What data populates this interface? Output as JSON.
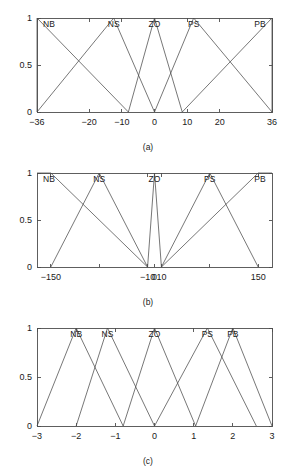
{
  "figure": {
    "panel_count": 3,
    "line_color": "#4a4a4a",
    "axis_color": "#4d4d4d",
    "background": "#ffffff"
  },
  "chart_data": [
    {
      "type": "line",
      "panel": "a",
      "caption": "(a)",
      "title": "",
      "xlabel": "",
      "ylabel": "",
      "xlim": [
        -36,
        36
      ],
      "ylim": [
        0,
        1
      ],
      "grid": false,
      "legend": "inline-top-labels",
      "xticks": [
        -36,
        -20,
        -10,
        0,
        10,
        20,
        36
      ],
      "xticklabels": [
        "-36",
        "-20",
        "-10",
        "0",
        "10",
        "20",
        "36"
      ],
      "yticks": [
        0,
        0.5,
        1
      ],
      "yticklabels": [
        "0",
        "0.5",
        "1"
      ],
      "series": [
        {
          "name": "NB",
          "label_x": -33.0,
          "shape": "triangle",
          "x": [
            -36,
            -36,
            -8
          ],
          "y": [
            0,
            1,
            0
          ]
        },
        {
          "name": "NS",
          "label_x": -12.5,
          "shape": "triangle",
          "x": [
            -36,
            -12.5,
            0
          ],
          "y": [
            0,
            1,
            0
          ]
        },
        {
          "name": "ZO",
          "label_x": 0.0,
          "shape": "triangle",
          "x": [
            -8,
            0,
            8.5
          ],
          "y": [
            0,
            1,
            0
          ]
        },
        {
          "name": "PS",
          "label_x": 12.0,
          "shape": "triangle",
          "x": [
            0,
            12,
            36
          ],
          "y": [
            0,
            1,
            0
          ]
        },
        {
          "name": "PB",
          "label_x": 33.0,
          "shape": "triangle",
          "x": [
            8.5,
            36,
            36
          ],
          "y": [
            0,
            1,
            0
          ]
        }
      ]
    },
    {
      "type": "line",
      "panel": "b",
      "caption": "(b)",
      "title": "",
      "xlabel": "",
      "ylabel": "",
      "xlim": [
        -170,
        170
      ],
      "ylim": [
        0,
        1
      ],
      "grid": false,
      "legend": "inline-top-labels",
      "xticks": [
        -150,
        -80,
        -10,
        0,
        10,
        80,
        150
      ],
      "xticklabels": [
        "-150",
        "",
        "-10",
        "0",
        "10",
        "",
        "150"
      ],
      "yticks": [
        0,
        0.5,
        1
      ],
      "yticklabels": [
        "0",
        "0.5",
        "1"
      ],
      "series": [
        {
          "name": "NB",
          "label_x": -155.0,
          "shape": "trapezoid",
          "x": [
            -170,
            -150,
            -10
          ],
          "y": [
            1,
            1,
            0
          ]
        },
        {
          "name": "NS",
          "label_x": -80.0,
          "shape": "triangle",
          "x": [
            -150,
            -80,
            -10
          ],
          "y": [
            0,
            1,
            0
          ]
        },
        {
          "name": "ZO",
          "label_x": 0.0,
          "shape": "triangle",
          "x": [
            -10,
            0,
            10
          ],
          "y": [
            0,
            1,
            0
          ]
        },
        {
          "name": "PS",
          "label_x": 80.0,
          "shape": "triangle",
          "x": [
            10,
            80,
            150
          ],
          "y": [
            0,
            1,
            0
          ]
        },
        {
          "name": "PB",
          "label_x": 155.0,
          "shape": "trapezoid",
          "x": [
            10,
            150,
            170
          ],
          "y": [
            0,
            1,
            1
          ]
        }
      ]
    },
    {
      "type": "line",
      "panel": "c",
      "caption": "(c)",
      "title": "",
      "xlabel": "",
      "ylabel": "",
      "xlim": [
        -3,
        3
      ],
      "ylim": [
        0,
        1
      ],
      "grid": false,
      "legend": "inline-top-labels",
      "xticks": [
        -3,
        -2,
        -1,
        0,
        1,
        2,
        3
      ],
      "xticklabels": [
        "-3",
        "-2",
        "-1",
        "0",
        "1",
        "2",
        "3"
      ],
      "yticks": [
        0,
        0.5,
        1
      ],
      "yticklabels": [
        "0",
        "0.5",
        "1"
      ],
      "series": [
        {
          "name": "NB",
          "label_x": -2.0,
          "shape": "triangle",
          "x": [
            -3,
            -2,
            -0.8
          ],
          "y": [
            0,
            1,
            0
          ]
        },
        {
          "name": "NS",
          "label_x": -1.2,
          "shape": "triangle",
          "x": [
            -2,
            -1.2,
            0
          ],
          "y": [
            0,
            1,
            0
          ]
        },
        {
          "name": "ZO",
          "label_x": 0.0,
          "shape": "triangle",
          "x": [
            -0.8,
            0,
            1.05
          ],
          "y": [
            0,
            1,
            0
          ]
        },
        {
          "name": "PS",
          "label_x": 1.35,
          "shape": "triangle",
          "x": [
            0,
            1.35,
            2.6
          ],
          "y": [
            0,
            1,
            0
          ]
        },
        {
          "name": "PB",
          "label_x": 2.0,
          "shape": "triangle",
          "x": [
            1.05,
            2,
            3
          ],
          "y": [
            0,
            1,
            0
          ]
        }
      ]
    }
  ]
}
